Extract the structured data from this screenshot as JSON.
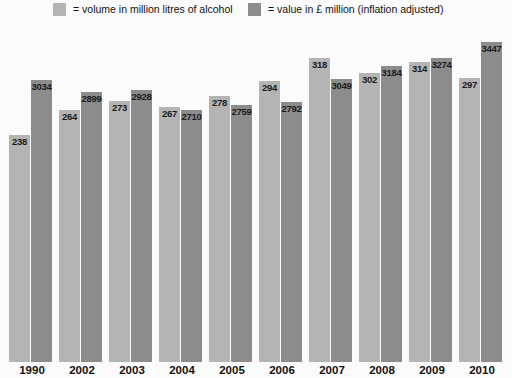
{
  "chart_data": {
    "type": "bar",
    "title": "",
    "xlabel": "",
    "ylabel": "",
    "grid": false,
    "legend_position": "top",
    "categories": [
      "1990",
      "2002",
      "2003",
      "2004",
      "2005",
      "2006",
      "2007",
      "2008",
      "2009",
      "2010"
    ],
    "series": [
      {
        "name": "volume in million litres of alcohol",
        "color": "#b4b4b4",
        "values": [
          238,
          264,
          273,
          267,
          278,
          294,
          318,
          302,
          314,
          297
        ]
      },
      {
        "name": "value in £ million (inflation adjusted)",
        "color": "#8c8c8c",
        "values": [
          3034,
          2899,
          2928,
          2710,
          2759,
          2792,
          3049,
          3184,
          3274,
          3447
        ]
      }
    ],
    "volume_axis_max": 360,
    "value_axis_max": 3700
  },
  "legend": {
    "items": [
      {
        "marker": "legend-swatch-volume",
        "label": "= volume in million litres of alcohol"
      },
      {
        "marker": "legend-swatch-value",
        "label": "= value in £ million (inflation adjusted)"
      }
    ]
  },
  "colors": {
    "background": "#fbfbfb",
    "volume_bar": "#b4b4b4",
    "value_bar": "#8c8c8c",
    "label_text": "#1a1a1a"
  }
}
